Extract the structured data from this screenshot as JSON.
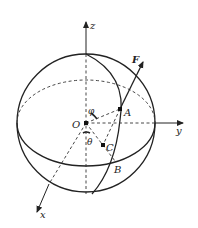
{
  "diagram": {
    "type": "spherical-coordinates-sphere",
    "axes": {
      "z": "z",
      "y": "y",
      "x": "x"
    },
    "points": {
      "origin": "O",
      "A": "A",
      "B": "B",
      "C": "C"
    },
    "vector": {
      "label": "F"
    },
    "angles": {
      "phi": "φ",
      "theta": "θ"
    },
    "colors": {
      "line": "#222222",
      "background": "#ffffff"
    }
  }
}
